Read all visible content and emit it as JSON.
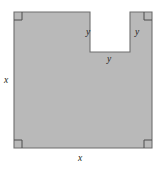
{
  "figure": {
    "kind": "geometry-diagram",
    "fill_color": "#b9b9b9",
    "stroke_color": "#6e6e6e",
    "background_color": "#ffffff",
    "label_color": "#231f20",
    "labels": {
      "x_left": "x",
      "x_bottom": "x",
      "y_notch_left": "y",
      "y_notch_right": "y",
      "y_notch_bottom": "y"
    },
    "right_angle_markers": [
      "top-left",
      "top-right",
      "bottom-left",
      "bottom-right"
    ],
    "geometry": {
      "square": {
        "left": 14,
        "top": 12,
        "right": 152,
        "bottom": 148,
        "side_label": "x"
      },
      "notch": {
        "left": 90,
        "top": 12,
        "right": 130,
        "bottom": 52,
        "width_label": "y",
        "height_label": "y"
      }
    }
  }
}
